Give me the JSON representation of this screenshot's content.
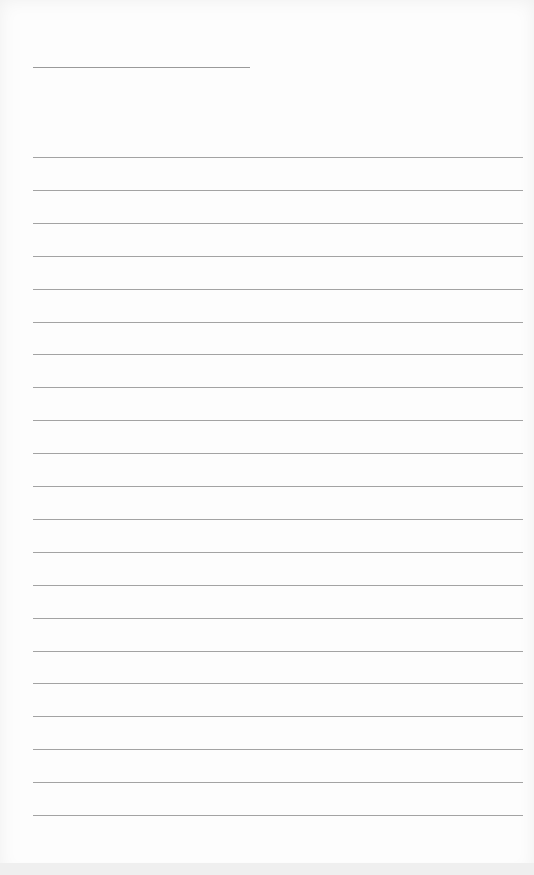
{
  "page": {
    "type": "lined-paper",
    "title_line": {
      "x": 33,
      "y": 67,
      "width": 217
    },
    "rules": {
      "count": 21,
      "start_y": 157,
      "spacing": 32.9,
      "x": 33,
      "width": 490
    },
    "line_color": "#a3a3a3",
    "background": "#fdfdfd"
  }
}
